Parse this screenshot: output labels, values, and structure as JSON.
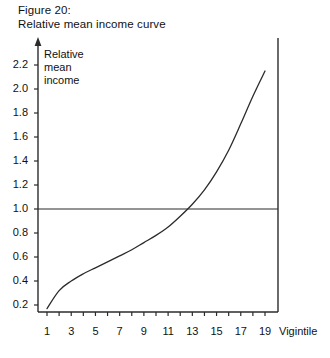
{
  "figure": {
    "caption_line1": "Figure 20:",
    "caption_line2": "Relative mean income curve"
  },
  "axes": {
    "y_title_line1": "Relative",
    "y_title_line2": "mean",
    "y_title_line3": "income",
    "x_title": "Vigintile"
  },
  "chart_data": {
    "type": "line",
    "title": "Figure 20: Relative mean income curve",
    "xlabel": "Vigintile",
    "ylabel": "Relative mean income",
    "xlim": [
      0,
      20
    ],
    "ylim": [
      0,
      2.3
    ],
    "grid": false,
    "legend": null,
    "y_ticks": [
      0.2,
      0.4,
      0.6,
      0.8,
      1.0,
      1.2,
      1.4,
      1.6,
      1.8,
      2.0,
      2.2
    ],
    "y_tick_labels": [
      "0.2",
      "0.4",
      "0.6",
      "0.8",
      "1.0",
      "1.2",
      "1.4",
      "1.6",
      "1.8",
      "2.0",
      "2.2"
    ],
    "x_ticks": [
      1,
      2,
      3,
      4,
      5,
      6,
      7,
      8,
      9,
      10,
      11,
      12,
      13,
      14,
      15,
      16,
      17,
      18,
      19,
      20
    ],
    "x_tick_labels_shown": [
      "1",
      "3",
      "5",
      "7",
      "9",
      "11",
      "13",
      "15",
      "17",
      "19"
    ],
    "x_tick_label_values": [
      1,
      3,
      5,
      7,
      9,
      11,
      13,
      15,
      17,
      19
    ],
    "reference_line": {
      "orientation": "horizontal",
      "value": 1.0,
      "label": "1.0"
    },
    "crossing_point": {
      "x": 12.4,
      "y": 1.0
    },
    "x": [
      1,
      2,
      3,
      4,
      5,
      6,
      7,
      8,
      9,
      10,
      11,
      12,
      13,
      14,
      15,
      16,
      17,
      18,
      19
    ],
    "values": [
      0.17,
      0.32,
      0.4,
      0.46,
      0.51,
      0.56,
      0.61,
      0.66,
      0.72,
      0.78,
      0.85,
      0.94,
      1.04,
      1.16,
      1.31,
      1.49,
      1.71,
      1.94,
      2.15
    ],
    "series": [
      {
        "name": "Relative mean income",
        "values": [
          0.17,
          0.32,
          0.4,
          0.46,
          0.51,
          0.56,
          0.61,
          0.66,
          0.72,
          0.78,
          0.85,
          0.94,
          1.04,
          1.16,
          1.31,
          1.49,
          1.71,
          1.94,
          2.15
        ]
      }
    ],
    "line_color": "#2b2b2b"
  }
}
